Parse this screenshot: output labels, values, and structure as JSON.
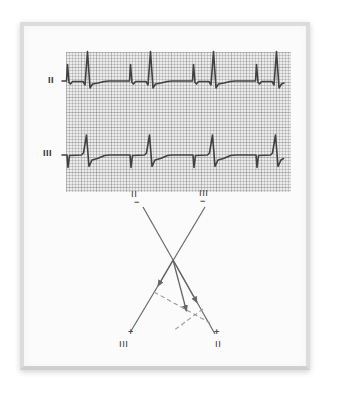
{
  "ecg": {
    "lead_top_label": "II",
    "lead_bottom_label": "III",
    "trace_lead2_points": "62,81 65,81 66.5,81 67.5,64.5 69,82.5 70.5,84 72.5,81.5 83,81.5 85,85 87.5,51.5 90,88 92.5,84 98,83 104,81.5 109,81 128,81 129.5,81 130.5,64.5 132,82.5 133.5,84 135.5,81.5 146,81.5 148,85 150.5,51.5 153,88 155.5,84 161,83 167,81.5 172,81 191,81 192.5,81 193.5,64.5 195,82.5 196.5,84 198.5,81.5 209,81.5 211,85 213.5,51.5 216,88 218.5,84 224,83 230,81.5 235,81 254,81 255.5,81 256.5,64.5 258,82.5 259.5,84 261.5,81.5 272,81.5 274,85 276.5,51.5 279,88 281.5,84 284,83",
    "trace_lead3_points": "62,155 65.5,155 67,155 68,167.5 69.5,155.5 81.5,155 83.5,153 86.5,135 89,166.5 92,160 97.5,158.5 104.5,155.5 109.5,155 128.5,155 130,155 131,167.5 132.5,155.5 144.5,155 146.5,153 149.5,135 152,166.5 155,160 160.5,158.5 167.5,155.5 172.5,155 191.5,155 193,155 194,167.5 195.5,155.5 207.5,155 209.5,153 212.5,135 215,166.5 218,160 223.5,158.5 230.5,155.5 235.5,155 254.5,155 256,155 257,167.5 258.5,155.5 270.5,155 272.5,153 275.5,135 278,166.5 281,160 283.5,158.5"
  },
  "vector_diagram": {
    "labels": {
      "top_left_lead": "II",
      "top_left_sign": "−",
      "top_right_lead": "III",
      "top_right_sign": "−",
      "bottom_left_sign": "+",
      "bottom_left_lead": "III",
      "bottom_right_sign": "+",
      "bottom_right_lead": "II"
    },
    "geometry": {
      "lead2_axis_d": "M143 207 L215 334",
      "lead3_axis_d": "M205 207 L131 331",
      "lead3_projection_arrow_d": "M173 260 L158 286",
      "lead2_projection_arrow_d": "M173 260 L197 302.5",
      "resultant_arrow_d": "M173 260 L186.5 311",
      "perpendicular_from_lead3_d": "M154 292 L210 323",
      "perpendicular_from_lead2_d": "M203 309 L173 331"
    }
  },
  "colors": {
    "trace": "#414141",
    "grid_background": "#ececec",
    "grid_line": "#7d7d7d",
    "axis_line": "#6a6a6a",
    "dashed_line": "#9b9b9b",
    "panel_frame": "#dcdcdc",
    "label_text": "#3a3a3a"
  }
}
